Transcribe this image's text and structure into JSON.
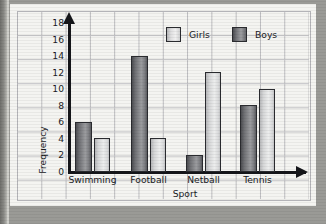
{
  "chart_data": {
    "type": "bar",
    "title": "",
    "xlabel": "Sport",
    "ylabel": "Frequency",
    "categories": [
      "Swimming",
      "Football",
      "Netball",
      "Tennis"
    ],
    "series": [
      {
        "name": "Boys",
        "color": "#6f7074",
        "values": [
          6,
          14,
          2,
          8
        ]
      },
      {
        "name": "Girls",
        "color": "#dedede",
        "values": [
          4,
          4,
          12,
          10
        ]
      }
    ],
    "bar_order_in_group": [
      "Boys",
      "Girls"
    ],
    "legend_order": [
      "Girls",
      "Boys"
    ],
    "legend_position": "top-right",
    "ylim": [
      0,
      18
    ],
    "ytick_step": 2,
    "yticks": [
      "18",
      "16",
      "14",
      "12",
      "10",
      "8",
      "6",
      "4",
      "2",
      "0"
    ],
    "grid": true,
    "grid_style": "graph-paper-squares"
  },
  "legend": {
    "girls_label": "Girls",
    "boys_label": "Boys"
  },
  "axes": {
    "y_title": "Frequency",
    "x_title": "Sport"
  }
}
